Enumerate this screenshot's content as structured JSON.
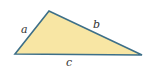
{
  "diagram": {
    "type": "triangle",
    "vertices": {
      "top": [
        49,
        11
      ],
      "left": [
        15,
        54
      ],
      "right": [
        142,
        55
      ]
    },
    "sides": [
      {
        "name": "a",
        "label": "a",
        "between": [
          "left",
          "top"
        ]
      },
      {
        "name": "b",
        "label": "b",
        "between": [
          "top",
          "right"
        ]
      },
      {
        "name": "c",
        "label": "c",
        "between": [
          "left",
          "right"
        ]
      }
    ],
    "colors": {
      "fill": "#f8e6a4",
      "stroke": "#3d6f88",
      "label": "#333333"
    }
  }
}
